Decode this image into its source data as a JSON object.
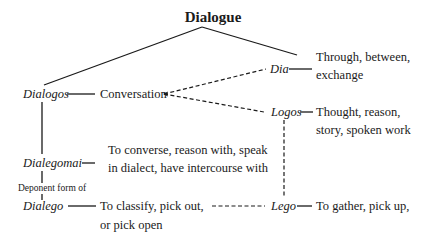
{
  "title": "Dialogue",
  "nodes": {
    "dialogos": {
      "term": "Dialogos",
      "meaning": "Conversation"
    },
    "dia": {
      "term": "Dia",
      "meaning_lines": [
        "Through, between,",
        "exchange"
      ]
    },
    "logos": {
      "term": "Logos",
      "meaning_lines": [
        "Thought, reason,",
        "story, spoken work"
      ]
    },
    "dialegomai": {
      "term": "Dialegomai",
      "meaning_lines": [
        "To converse, reason with, speak",
        "in dialect, have intercourse with"
      ]
    },
    "deponent": {
      "label": "Deponent form of"
    },
    "dialego": {
      "term": "Dialego",
      "meaning_lines": [
        "To classify, pick out,",
        "or pick open"
      ]
    },
    "lego": {
      "term": "Lego",
      "meaning_lines": [
        "To gather, pick up,"
      ]
    }
  },
  "colors": {
    "ink": "#1a1a1a",
    "background": "#ffffff"
  }
}
